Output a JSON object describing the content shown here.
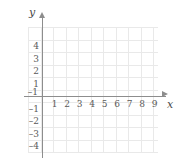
{
  "figure": {
    "type": "coordinate-plane",
    "background": "#ffffff",
    "grid_color": "#e9e9e9",
    "axis_color": "#8d8d8d",
    "label_color": "#5a5a5a"
  },
  "axes": {
    "x_name": "x",
    "y_name": "y",
    "x_labels": [
      "1",
      "2",
      "3",
      "4",
      "5",
      "6",
      "7",
      "8",
      "9"
    ],
    "y_labels_positive": [
      "4",
      "3",
      "2",
      "1"
    ],
    "y_labels_negative": [
      "–1",
      "–2",
      "–3",
      "–4"
    ],
    "x_negative_label": "–1"
  },
  "chart_data": {
    "type": "scatter",
    "title": "",
    "xlabel": "x",
    "ylabel": "y",
    "x": [],
    "y": [],
    "series": [],
    "xlim": [
      -1,
      10
    ],
    "ylim": [
      -5,
      5
    ],
    "xticks": [
      -1,
      1,
      2,
      3,
      4,
      5,
      6,
      7,
      8,
      9
    ],
    "yticks": [
      -4,
      -3,
      -2,
      -1,
      1,
      2,
      3,
      4
    ],
    "xtick_labels": [
      "–1",
      "1",
      "2",
      "3",
      "4",
      "5",
      "6",
      "7",
      "8",
      "9"
    ],
    "ytick_labels": [
      "–4",
      "–3",
      "–2",
      "–1",
      "1",
      "2",
      "3",
      "4"
    ],
    "grid": true,
    "legend": null,
    "annotations": []
  }
}
